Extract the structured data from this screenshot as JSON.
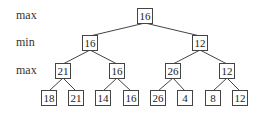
{
  "levels": [
    {
      "label": "max",
      "y": 16
    },
    {
      "label": "min",
      "y": 43
    },
    {
      "label": "max",
      "y": 71
    }
  ],
  "nodes": [
    {
      "id": "root",
      "value": "16",
      "x": 145,
      "y": 16
    },
    {
      "id": "min-left",
      "value": "16",
      "x": 90,
      "y": 43
    },
    {
      "id": "min-right",
      "value": "12",
      "x": 200,
      "y": 43
    },
    {
      "id": "max-1",
      "value": "21",
      "x": 63,
      "y": 71
    },
    {
      "id": "max-2",
      "value": "16",
      "x": 117,
      "y": 71
    },
    {
      "id": "max-3",
      "value": "26",
      "x": 173,
      "y": 71
    },
    {
      "id": "max-4",
      "value": "12",
      "x": 227,
      "y": 71
    },
    {
      "id": "leaf-1",
      "value": "18",
      "x": 49,
      "y": 98
    },
    {
      "id": "leaf-2",
      "value": "21",
      "x": 76,
      "y": 98
    },
    {
      "id": "leaf-3",
      "value": "14",
      "x": 103,
      "y": 98
    },
    {
      "id": "leaf-4",
      "value": "16",
      "x": 131,
      "y": 98
    },
    {
      "id": "leaf-5",
      "value": "26",
      "x": 158,
      "y": 98
    },
    {
      "id": "leaf-6",
      "value": "4",
      "x": 185,
      "y": 98
    },
    {
      "id": "leaf-7",
      "value": "8",
      "x": 213,
      "y": 98
    },
    {
      "id": "leaf-8",
      "value": "12",
      "x": 240,
      "y": 98
    }
  ],
  "edges": [
    [
      "root",
      "min-left"
    ],
    [
      "root",
      "min-right"
    ],
    [
      "min-left",
      "max-1"
    ],
    [
      "min-left",
      "max-2"
    ],
    [
      "min-right",
      "max-3"
    ],
    [
      "min-right",
      "max-4"
    ],
    [
      "max-1",
      "leaf-1"
    ],
    [
      "max-1",
      "leaf-2"
    ],
    [
      "max-2",
      "leaf-3"
    ],
    [
      "max-2",
      "leaf-4"
    ],
    [
      "max-3",
      "leaf-5"
    ],
    [
      "max-3",
      "leaf-6"
    ],
    [
      "max-4",
      "leaf-7"
    ],
    [
      "max-4",
      "leaf-8"
    ]
  ]
}
